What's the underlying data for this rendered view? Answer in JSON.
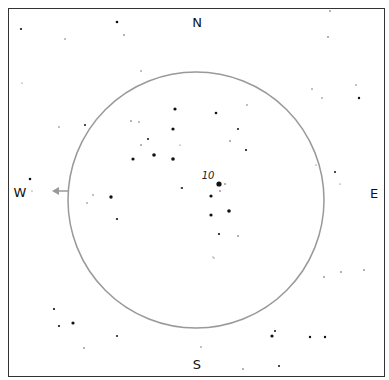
{
  "compass": {
    "north": "N",
    "south": "S",
    "east": "E",
    "west": "W"
  },
  "field_circle": {
    "cx": 196,
    "cy": 200,
    "r": 128,
    "color": "#999999"
  },
  "target_label": {
    "text": "10",
    "x": 208,
    "y": 175
  },
  "motion_arrow": {
    "from_x": 68,
    "to_x": 52,
    "y": 191,
    "color": "#999999"
  },
  "frame": {
    "x": 8,
    "y": 8,
    "width": 377,
    "height": 369
  },
  "stars": [
    {
      "x": 21,
      "y": 29,
      "r": 1.1
    },
    {
      "x": 117,
      "y": 22,
      "r": 1.3
    },
    {
      "x": 124,
      "y": 35,
      "r": 0.8
    },
    {
      "x": 65,
      "y": 39,
      "r": 0.7
    },
    {
      "x": 22,
      "y": 83,
      "r": 0.6
    },
    {
      "x": 141,
      "y": 71,
      "r": 0.7
    },
    {
      "x": 85,
      "y": 125,
      "r": 1.0
    },
    {
      "x": 59,
      "y": 127,
      "r": 0.7
    },
    {
      "x": 330,
      "y": 11,
      "r": 0.8
    },
    {
      "x": 328,
      "y": 37,
      "r": 0.8
    },
    {
      "x": 356,
      "y": 85,
      "r": 0.7
    },
    {
      "x": 322,
      "y": 98,
      "r": 0.7
    },
    {
      "x": 312,
      "y": 89,
      "r": 0.7
    },
    {
      "x": 359,
      "y": 98,
      "r": 1.2
    },
    {
      "x": 175,
      "y": 109,
      "r": 1.6
    },
    {
      "x": 131,
      "y": 121,
      "r": 0.8
    },
    {
      "x": 139,
      "y": 122,
      "r": 0.7
    },
    {
      "x": 173,
      "y": 129,
      "r": 1.6
    },
    {
      "x": 216,
      "y": 113,
      "r": 1.3
    },
    {
      "x": 247,
      "y": 105,
      "r": 0.7
    },
    {
      "x": 148,
      "y": 139,
      "r": 1.0
    },
    {
      "x": 141,
      "y": 145,
      "r": 0.8
    },
    {
      "x": 133,
      "y": 159,
      "r": 1.6
    },
    {
      "x": 154,
      "y": 155,
      "r": 1.8
    },
    {
      "x": 173,
      "y": 159,
      "r": 1.8
    },
    {
      "x": 180,
      "y": 145,
      "r": 0.6
    },
    {
      "x": 238,
      "y": 129,
      "r": 1.0
    },
    {
      "x": 230,
      "y": 141,
      "r": 0.8
    },
    {
      "x": 246,
      "y": 150,
      "r": 1.1
    },
    {
      "x": 219,
      "y": 184,
      "r": 2.6
    },
    {
      "x": 225,
      "y": 184,
      "r": 0.8
    },
    {
      "x": 220,
      "y": 191,
      "r": 0.8
    },
    {
      "x": 182,
      "y": 188,
      "r": 1.0
    },
    {
      "x": 211,
      "y": 196,
      "r": 1.6
    },
    {
      "x": 229,
      "y": 211,
      "r": 1.8
    },
    {
      "x": 211,
      "y": 215,
      "r": 1.6
    },
    {
      "x": 219,
      "y": 234,
      "r": 1.1
    },
    {
      "x": 238,
      "y": 236,
      "r": 0.8
    },
    {
      "x": 214,
      "y": 258,
      "r": 0.6
    },
    {
      "x": 111,
      "y": 197,
      "r": 1.7
    },
    {
      "x": 93,
      "y": 195,
      "r": 0.7
    },
    {
      "x": 87,
      "y": 203,
      "r": 0.7
    },
    {
      "x": 117,
      "y": 219,
      "r": 1.1
    },
    {
      "x": 181,
      "y": 188,
      "r": 0.6
    },
    {
      "x": 30,
      "y": 179,
      "r": 1.3
    },
    {
      "x": 32,
      "y": 191,
      "r": 0.6
    },
    {
      "x": 316,
      "y": 165,
      "r": 0.6
    },
    {
      "x": 335,
      "y": 172,
      "r": 1.0
    },
    {
      "x": 340,
      "y": 184,
      "r": 0.6
    },
    {
      "x": 324,
      "y": 277,
      "r": 0.8
    },
    {
      "x": 341,
      "y": 272,
      "r": 0.8
    },
    {
      "x": 364,
      "y": 270,
      "r": 0.8
    },
    {
      "x": 54,
      "y": 309,
      "r": 1.1
    },
    {
      "x": 59,
      "y": 326,
      "r": 1.1
    },
    {
      "x": 73,
      "y": 323,
      "r": 1.6
    },
    {
      "x": 84,
      "y": 348,
      "r": 0.8
    },
    {
      "x": 117,
      "y": 336,
      "r": 1.0
    },
    {
      "x": 201,
      "y": 347,
      "r": 0.7
    },
    {
      "x": 243,
      "y": 369,
      "r": 0.8
    },
    {
      "x": 275,
      "y": 331,
      "r": 1.0
    },
    {
      "x": 272,
      "y": 336,
      "r": 1.6
    },
    {
      "x": 310,
      "y": 337,
      "r": 1.2
    },
    {
      "x": 325,
      "y": 337,
      "r": 1.2
    },
    {
      "x": 279,
      "y": 366,
      "r": 1.0
    },
    {
      "x": 213,
      "y": 257,
      "r": 0.6
    }
  ]
}
